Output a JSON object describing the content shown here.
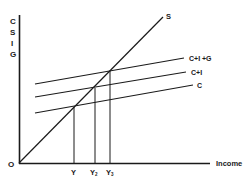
{
  "diagram": {
    "type": "keynesian-cross",
    "y_axis_label": [
      "C",
      "S",
      "I",
      "G"
    ],
    "x_axis_label": "Income",
    "origin_label": "O",
    "lines": [
      {
        "name": "S",
        "label": "S"
      },
      {
        "name": "C+I+G",
        "label": "C+I +G"
      },
      {
        "name": "C+I",
        "label": "C+I"
      },
      {
        "name": "C",
        "label": "C"
      }
    ],
    "equilibria": [
      {
        "label": "Y",
        "sub": ""
      },
      {
        "label": "Y",
        "sub": "2"
      },
      {
        "label": "Y",
        "sub": "3"
      }
    ],
    "colors": {
      "line": "#1a1a1a",
      "background": "#ffffff"
    }
  }
}
